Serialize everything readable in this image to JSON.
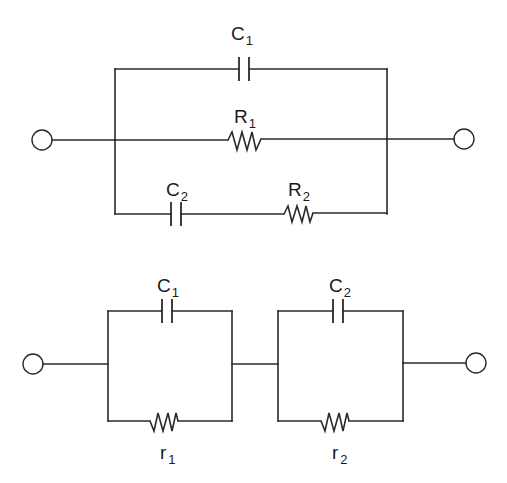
{
  "diagram": {
    "type": "equivalent-circuit",
    "circuits": [
      {
        "id": "top",
        "description": "C1, R1 and series (C2-R2) branch connected in parallel between two terminals",
        "components": [
          {
            "id": "C1",
            "kind": "capacitor",
            "label": "C",
            "subscript": "1",
            "branch": "top"
          },
          {
            "id": "R1",
            "kind": "resistor",
            "label": "R",
            "subscript": "1",
            "branch": "middle"
          },
          {
            "id": "C2",
            "kind": "capacitor",
            "label": "C",
            "subscript": "2",
            "branch": "bottom"
          },
          {
            "id": "R2",
            "kind": "resistor",
            "label": "R",
            "subscript": "2",
            "branch": "bottom"
          }
        ]
      },
      {
        "id": "bottom",
        "description": "Two parallel RC cells (C1||r1) and (C2||r2) connected in series between two terminals",
        "components": [
          {
            "id": "C1b",
            "kind": "capacitor",
            "label": "C",
            "subscript": "1",
            "cell": 1
          },
          {
            "id": "r1",
            "kind": "resistor",
            "label": "r",
            "subscript": "1",
            "cell": 1
          },
          {
            "id": "C2b",
            "kind": "capacitor",
            "label": "C",
            "subscript": "2",
            "cell": 2
          },
          {
            "id": "r2",
            "kind": "resistor",
            "label": "r",
            "subscript": "2",
            "cell": 2
          }
        ]
      }
    ],
    "colors": {
      "line": "#2a2a2a",
      "background": "#ffffff"
    }
  }
}
